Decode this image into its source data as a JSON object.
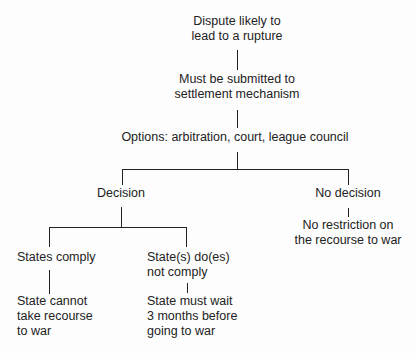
{
  "diagram": {
    "type": "flowchart-tree",
    "nodes": {
      "root": {
        "lines": [
          "Dispute likely to",
          "lead to a rupture"
        ]
      },
      "submit": {
        "lines": [
          "Must be submitted to",
          "settlement mechanism"
        ]
      },
      "options": {
        "lines": [
          "Options: arbitration, court, league council"
        ]
      },
      "decision": {
        "lines": [
          "Decision"
        ]
      },
      "no_decision": {
        "lines": [
          "No decision"
        ]
      },
      "no_restriction": {
        "lines": [
          "No restriction on",
          "the recourse to war"
        ]
      },
      "comply": {
        "lines": [
          "States comply"
        ]
      },
      "not_comply": {
        "lines": [
          "State(s) do(es)",
          "not comply"
        ]
      },
      "cannot_war": {
        "lines": [
          "State cannot",
          "take recourse",
          "to war"
        ]
      },
      "must_wait": {
        "lines": [
          "State must wait",
          "3 months before",
          "going to war"
        ]
      }
    },
    "edges": [
      [
        "root",
        "submit"
      ],
      [
        "submit",
        "options"
      ],
      [
        "options",
        "decision"
      ],
      [
        "options",
        "no_decision"
      ],
      [
        "no_decision",
        "no_restriction"
      ],
      [
        "decision",
        "comply"
      ],
      [
        "decision",
        "not_comply"
      ],
      [
        "comply",
        "cannot_war"
      ],
      [
        "not_comply",
        "must_wait"
      ]
    ]
  }
}
